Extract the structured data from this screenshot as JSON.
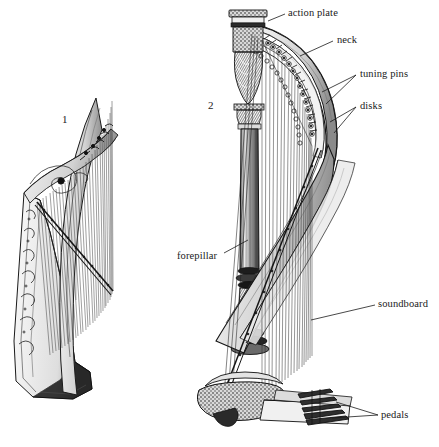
{
  "figure": {
    "type": "line-engraving illustration",
    "background_color": "#ffffff",
    "ink_color": "#1a1a1a"
  },
  "figure_numbers": [
    {
      "name": "celtic-harp",
      "text": "1",
      "x": 64,
      "y": 117
    },
    {
      "name": "pedal-harp",
      "text": "2",
      "x": 210,
      "y": 103
    }
  ],
  "labels": [
    {
      "id": "action-plate",
      "text": "action plate",
      "x": 288,
      "y": 8,
      "leader": [
        [
          285,
          14
        ],
        [
          268,
          20
        ]
      ]
    },
    {
      "id": "neck",
      "text": "neck",
      "x": 337,
      "y": 35,
      "leader": [
        [
          333,
          41
        ],
        [
          300,
          55
        ]
      ]
    },
    {
      "id": "tuning-pins",
      "text": "tuning pins",
      "x": 360,
      "y": 69,
      "leader": [
        [
          356,
          75
        ],
        [
          323,
          88
        ]
      ]
    },
    {
      "id": "disks",
      "text": "disks",
      "x": 360,
      "y": 101,
      "leader": [
        [
          356,
          107
        ],
        [
          330,
          116
        ]
      ]
    },
    {
      "id": "forepillar",
      "text": "forepillar",
      "x": 177,
      "y": 251,
      "leader": [
        [
          224,
          253
        ],
        [
          247,
          240
        ]
      ]
    },
    {
      "id": "soundboard",
      "text": "soundboard",
      "x": 378,
      "y": 299,
      "leader": [
        [
          375,
          305
        ],
        [
          312,
          318
        ]
      ]
    },
    {
      "id": "pedals",
      "text": "pedals",
      "x": 381,
      "y": 410,
      "leader": [
        [
          378,
          415
        ],
        [
          352,
          411
        ]
      ]
    }
  ],
  "celtic_harp": {
    "name": "Irish / Celtic harp",
    "string_count": 30,
    "has_pedals": false,
    "parts": [
      "soundbox",
      "neck",
      "forepillar",
      "strings",
      "scroll"
    ]
  },
  "pedal_harp": {
    "name": "Concert pedal harp",
    "string_count": 44,
    "pedal_count": 7,
    "parts": [
      "action plate",
      "neck",
      "tuning pins",
      "disks",
      "forepillar",
      "soundboard",
      "pedals",
      "base"
    ]
  }
}
